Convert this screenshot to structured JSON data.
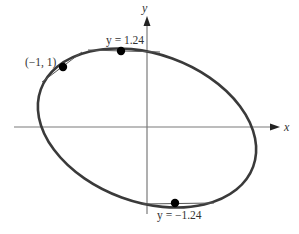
{
  "figure": {
    "type": "ellipse-with-horizontal-tangents",
    "axes": {
      "x_label": "x",
      "y_label": "y"
    },
    "points": [
      {
        "id": "top",
        "label": "y = 1.24",
        "desc": "horizontal tangent at maximum"
      },
      {
        "id": "given",
        "label": "(−1, 1)",
        "desc": "point with tangent line"
      },
      {
        "id": "bottom",
        "label": "y = −1.24",
        "desc": "horizontal tangent at minimum"
      }
    ],
    "colors": {
      "curve": "#3a3a3a",
      "axis": "#808080",
      "point": "#000000",
      "text": "#333333"
    }
  }
}
